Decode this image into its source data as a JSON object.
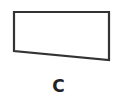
{
  "figure": {
    "label": "C",
    "shape": {
      "type": "quadrilateral",
      "points": [
        [
          14,
          12
        ],
        [
          109,
          12
        ],
        [
          109,
          60
        ],
        [
          14,
          51
        ]
      ],
      "stroke": "#333333",
      "stroke_width": 2.2,
      "fill": "#ffffff"
    }
  }
}
